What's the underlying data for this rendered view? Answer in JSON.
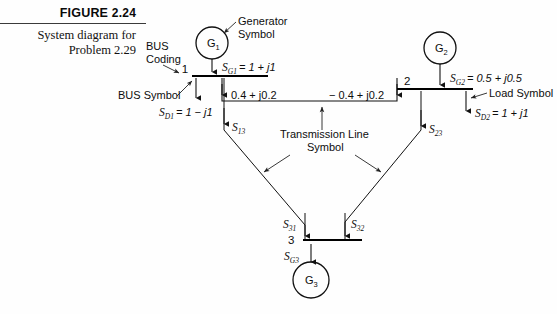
{
  "caption": {
    "figure_word": "FIGURE",
    "figure_number": "2.24",
    "description_line1": "System diagram for",
    "description_line2": "Problem 2.29"
  },
  "annotations": {
    "generator_symbol_line1": "Generator",
    "generator_symbol_line2": "Symbol",
    "bus_coding_line1": "BUS",
    "bus_coding_line2": "Coding",
    "bus_symbol": "BUS Symbol",
    "load_symbol": "Load Symbol",
    "transmission_line_symbol_line1": "Transmission Line",
    "transmission_line_symbol_line2": "Symbol"
  },
  "buses": [
    {
      "id": "bus-1",
      "number": "1"
    },
    {
      "id": "bus-2",
      "number": "2"
    },
    {
      "id": "bus-3",
      "number": "3"
    }
  ],
  "generators": [
    {
      "id": "g1",
      "label": "G",
      "subscript": "1"
    },
    {
      "id": "g2",
      "label": "G",
      "subscript": "2"
    },
    {
      "id": "g3",
      "label": "G",
      "subscript": "3"
    }
  ],
  "quantities": {
    "s_g1": {
      "symbol": "S",
      "subscript": "G1",
      "value": "= 1 + j1"
    },
    "s_g2": {
      "symbol": "S",
      "subscript": "G2",
      "value": "= 0.5 + j0.5"
    },
    "s_g3": {
      "symbol": "S",
      "subscript": "G3",
      "value": ""
    },
    "s_d1": {
      "symbol": "S",
      "subscript": "D1",
      "value": "= 1 − j1"
    },
    "s_d2": {
      "symbol": "S",
      "subscript": "D2",
      "value": "= 1 + j1"
    },
    "s_13": {
      "symbol": "S",
      "subscript": "13",
      "value": ""
    },
    "s_23": {
      "symbol": "S",
      "subscript": "23",
      "value": ""
    },
    "s_31": {
      "symbol": "S",
      "subscript": "31",
      "value": ""
    },
    "s_32": {
      "symbol": "S",
      "subscript": "32",
      "value": ""
    }
  },
  "line_flows": {
    "flow_1_to_2": "0.4 + j0.2",
    "flow_2_to_1": "− 0.4 + j0.2"
  },
  "colors": {
    "ink": "#111111",
    "paper": "#fefefe",
    "rule": "#3a3a3a"
  }
}
